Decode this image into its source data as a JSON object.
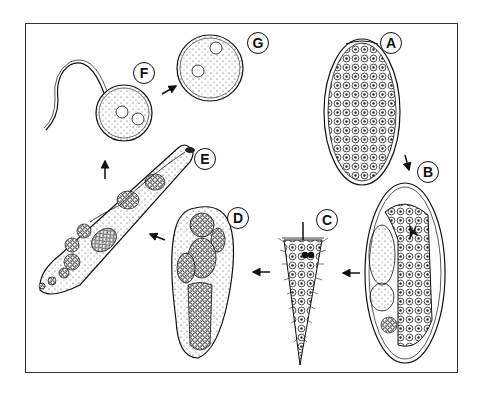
{
  "figure": {
    "type": "life-cycle diagram",
    "stages": [
      {
        "id": "A",
        "label": "A",
        "depiction": "operculated egg filled with cells"
      },
      {
        "id": "B",
        "label": "B",
        "depiction": "egg containing developing miracidium"
      },
      {
        "id": "C",
        "label": "C",
        "depiction": "ciliated miracidium"
      },
      {
        "id": "D",
        "label": "D",
        "depiction": "sporocyst with germ balls"
      },
      {
        "id": "E",
        "label": "E",
        "depiction": "elongated redia containing developing cercariae"
      },
      {
        "id": "F",
        "label": "F",
        "depiction": "tailed cercaria"
      },
      {
        "id": "G",
        "label": "G",
        "depiction": "encysted metacercaria"
      }
    ],
    "arrows": [
      {
        "from": "A",
        "to": "B"
      },
      {
        "from": "B",
        "to": "C"
      },
      {
        "from": "C",
        "to": "D"
      },
      {
        "from": "D",
        "to": "E"
      },
      {
        "from": "E",
        "to": "F"
      },
      {
        "from": "F",
        "to": "G"
      }
    ],
    "colors": {
      "ink": "#111111",
      "background": "#ffffff",
      "frame": "#333333"
    }
  }
}
